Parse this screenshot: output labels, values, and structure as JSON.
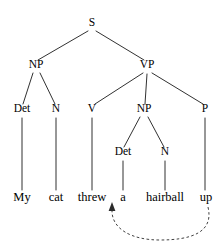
{
  "figure": {
    "kind": "constituency-syntax-tree",
    "sentence": "My cat threw a hairball up",
    "background_color": "#ffffff",
    "ink_color": "#1a1a1a"
  },
  "nodes": {
    "s": {
      "label": "S",
      "x": 92,
      "y": 26
    },
    "np_subject": {
      "label": "NP",
      "x": 36,
      "y": 68
    },
    "vp": {
      "label": "VP",
      "x": 147,
      "y": 68
    },
    "det_subject": {
      "label": "Det",
      "x": 22,
      "y": 112
    },
    "n_subject": {
      "label": "N",
      "x": 56,
      "y": 112
    },
    "v": {
      "label": "V",
      "x": 92,
      "y": 112
    },
    "np_object": {
      "label": "NP",
      "x": 144,
      "y": 112
    },
    "p": {
      "label": "P",
      "x": 205,
      "y": 112
    },
    "det_object": {
      "label": "Det",
      "x": 123,
      "y": 155
    },
    "n_object": {
      "label": "N",
      "x": 165,
      "y": 155
    }
  },
  "words": [
    {
      "text": "My",
      "x": 22,
      "y": 201
    },
    {
      "text": "cat",
      "x": 56,
      "y": 201
    },
    {
      "text": "threw",
      "x": 92,
      "y": 201
    },
    {
      "text": "a",
      "x": 123,
      "y": 201
    },
    {
      "text": "hairball",
      "x": 165,
      "y": 201
    },
    {
      "text": "up",
      "x": 206,
      "y": 201
    }
  ],
  "movement_arc": {
    "description": "dashed arc from particle up to post-verbal position",
    "color": "#2b2b2b",
    "style": "dashed",
    "from_x": 208,
    "to_x": 112,
    "bottom_y": 238
  }
}
